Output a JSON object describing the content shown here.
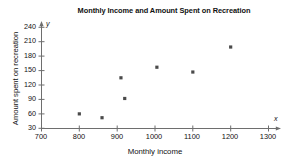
{
  "chart_data": {
    "type": "scatter",
    "title": "Monthly Income and Amount Spent on Recreation",
    "xlabel": "Monthly income",
    "ylabel": "Amount spent on recreation",
    "xlim": [
      700,
      1300
    ],
    "ylim": [
      30,
      240
    ],
    "xticks": [
      700,
      800,
      900,
      1000,
      1100,
      1200,
      1300
    ],
    "yticks": [
      30,
      60,
      90,
      120,
      150,
      180,
      210,
      240
    ],
    "xtick_labels": [
      "700",
      "800",
      "900",
      "1000",
      "1100",
      "1200",
      "1300"
    ],
    "ytick_labels": [
      "30",
      "60",
      "90",
      "120",
      "150",
      "180",
      "210",
      "240"
    ],
    "grid": false,
    "legend": null,
    "axis_x_letter": "x",
    "axis_y_letter": "y",
    "marker_color": "#4a4a4a",
    "points": [
      {
        "x": 800,
        "y": 60
      },
      {
        "x": 860,
        "y": 52
      },
      {
        "x": 910,
        "y": 135
      },
      {
        "x": 920,
        "y": 92
      },
      {
        "x": 1005,
        "y": 157
      },
      {
        "x": 1100,
        "y": 147
      },
      {
        "x": 1200,
        "y": 199
      }
    ],
    "series": [
      {
        "name": "Recreation spending",
        "x": [
          800,
          860,
          910,
          920,
          1005,
          1100,
          1200
        ],
        "values": [
          60,
          52,
          135,
          92,
          157,
          147,
          199
        ]
      }
    ]
  }
}
